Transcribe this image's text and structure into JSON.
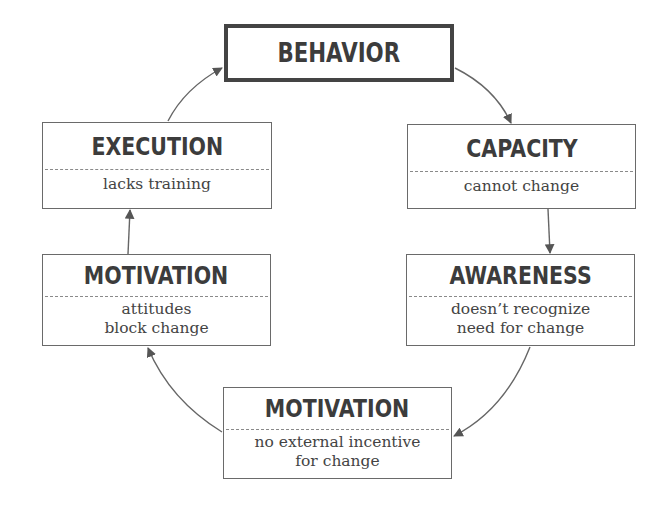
{
  "diagram": {
    "type": "cycle",
    "colors": {
      "border_primary": "#444444",
      "border": "#6a6a6a",
      "divider": "#8a8a8a",
      "arrow": "#555555",
      "text": "#3c3c3c"
    },
    "nodes": [
      {
        "id": "behavior",
        "title": "BEHAVIOR",
        "lines": []
      },
      {
        "id": "capacity",
        "title": "CAPACITY",
        "lines": [
          "cannot change"
        ]
      },
      {
        "id": "awareness",
        "title": "AWARENESS",
        "lines": [
          "doesn’t recognize",
          "need for change"
        ]
      },
      {
        "id": "motivation-external",
        "title": "MOTIVATION",
        "lines": [
          "no external incentive",
          "for change"
        ]
      },
      {
        "id": "motivation-attitudes",
        "title": "MOTIVATION",
        "lines": [
          "attitudes",
          "block change"
        ]
      },
      {
        "id": "execution",
        "title": "EXECUTION",
        "lines": [
          "lacks training"
        ]
      }
    ],
    "edges": [
      {
        "from": "behavior",
        "to": "capacity"
      },
      {
        "from": "capacity",
        "to": "awareness"
      },
      {
        "from": "awareness",
        "to": "motivation-external"
      },
      {
        "from": "motivation-external",
        "to": "motivation-attitudes"
      },
      {
        "from": "motivation-attitudes",
        "to": "execution"
      },
      {
        "from": "execution",
        "to": "behavior"
      }
    ]
  }
}
